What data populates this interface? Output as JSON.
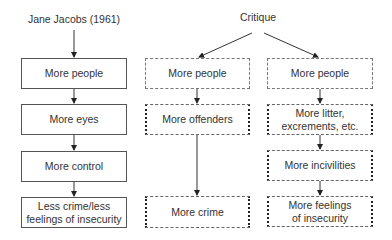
{
  "headings": {
    "left": "Jane Jacobs (1961)",
    "right": "Critique"
  },
  "columns": {
    "jacobs": {
      "boxes": [
        {
          "label": "More people",
          "style": "solid"
        },
        {
          "label": "More eyes",
          "style": "solid"
        },
        {
          "label": "More control",
          "style": "solid"
        },
        {
          "label": "Less crime/less feelings of insecurity",
          "style": "solid"
        }
      ]
    },
    "critique_crime": {
      "boxes": [
        {
          "label": "More people",
          "style": "dashed"
        },
        {
          "label": "More offenders",
          "style": "dotted-sides"
        },
        {
          "label": "More crime",
          "style": "dotted-sides"
        }
      ]
    },
    "critique_incivility": {
      "boxes": [
        {
          "label": "More people",
          "style": "dashed"
        },
        {
          "label": "More litter, excrements, etc.",
          "style": "dotted-sides"
        },
        {
          "label": "More incivilities",
          "style": "dotted-sides"
        },
        {
          "label": "More feelings of insecurity",
          "style": "dotted-sides"
        }
      ]
    }
  },
  "colors": {
    "line": "#333333",
    "text": "#333333"
  }
}
